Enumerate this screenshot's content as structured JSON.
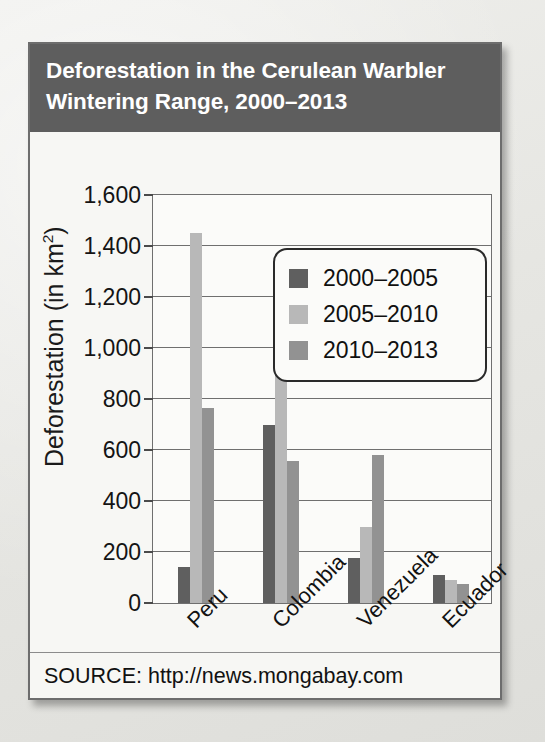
{
  "card": {
    "title_line1": "Deforestation in the Cerulean Warbler",
    "title_line2": "Wintering Range, 2000–2013",
    "source": "SOURCE: http://news.mongabay.com"
  },
  "colors": {
    "title_bar": "#5e5e5e",
    "series_2000_2005": "#5f5f5f",
    "series_2005_2010": "#b8b8b8",
    "series_2010_2013": "#929292",
    "axis": "#6f6f6f",
    "card_background": "#f7f7f4"
  },
  "chart_data": {
    "type": "bar",
    "title": "Deforestation in the Cerulean Warbler Wintering Range, 2000–2013",
    "xlabel": "",
    "ylabel": "Deforestation (in km2)",
    "ylabel_display": "Deforestation (in km",
    "ylabel_superscript": "2",
    "ylabel_suffix": ")",
    "categories": [
      "Peru",
      "Colombia",
      "Venezuela",
      "Ecuador"
    ],
    "series": [
      {
        "name": "2000–2005",
        "color": "#5f5f5f",
        "values": [
          140,
          700,
          175,
          110
        ]
      },
      {
        "name": "2005–2010",
        "color": "#b8b8b8",
        "values": [
          1450,
          1240,
          300,
          90
        ]
      },
      {
        "name": "2010–2013",
        "color": "#929292",
        "values": [
          765,
          555,
          580,
          75
        ]
      }
    ],
    "ylim": [
      0,
      1600
    ],
    "yticks": [
      0,
      200,
      400,
      600,
      800,
      1000,
      1200,
      1400,
      1600
    ],
    "ytick_labels": [
      "0",
      "200",
      "400",
      "600",
      "800",
      "1,000",
      "1,200",
      "1,400",
      "1,600"
    ],
    "grid": true,
    "legend_position": "upper right",
    "xtick_rotation": -45
  }
}
